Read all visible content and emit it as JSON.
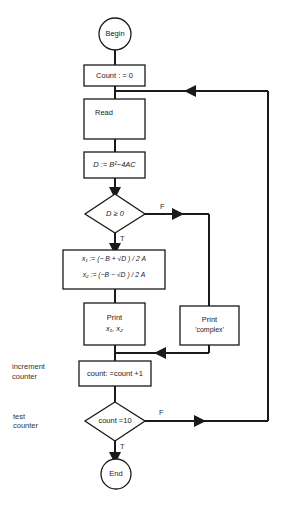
{
  "diagram": {
    "type": "flowchart",
    "nodes": {
      "begin": {
        "shape": "terminal",
        "label": "Begin"
      },
      "init": {
        "shape": "process",
        "label": "Count : = 0"
      },
      "read": {
        "shape": "process",
        "label": "Read"
      },
      "disc": {
        "shape": "process",
        "label": "D := B²−4AC"
      },
      "decide_d": {
        "shape": "decision",
        "label": "D ≥ 0"
      },
      "roots": {
        "shape": "process",
        "line1": "x₁ := (− B + √D ) / 2 A",
        "line2": "x₂ := (−B − √D ) / 2 A"
      },
      "print_x": {
        "shape": "process",
        "line1": "Print",
        "line2": "x₁, x₂"
      },
      "print_complex": {
        "shape": "process",
        "line1": "Print",
        "line2": "'complex'"
      },
      "increment": {
        "shape": "process",
        "label": "count: =count +1"
      },
      "test": {
        "shape": "decision",
        "label": "count =10"
      },
      "end": {
        "shape": "terminal",
        "label": "End"
      }
    },
    "edge_labels": {
      "decide_d_true": "T",
      "decide_d_false": "F",
      "test_true": "T",
      "test_false": "F"
    },
    "annotations": {
      "increment": {
        "line1": "increment",
        "line2": "counter"
      },
      "test": {
        "line1": "test",
        "line2": "counter"
      }
    },
    "colors": {
      "line": "#1a1a1a",
      "background": "#ffffff"
    }
  }
}
